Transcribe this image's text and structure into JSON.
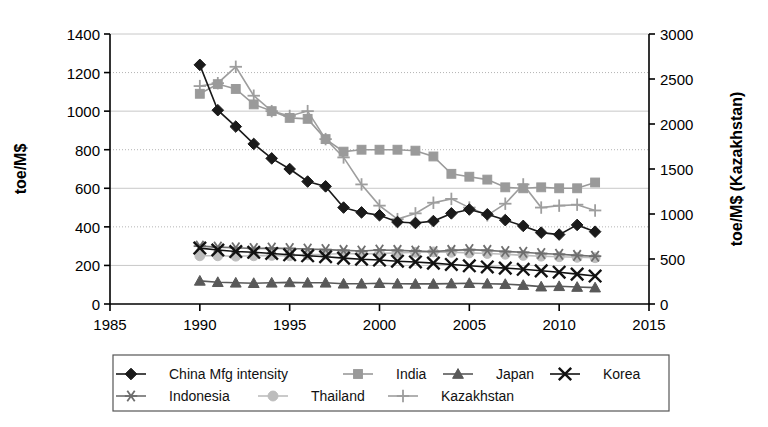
{
  "chart_data": {
    "type": "line",
    "title": "",
    "xlabel": "",
    "ylabel": "toe/M$",
    "ylabel_right": "toe/M$ (Kazakhstan)",
    "xlim": [
      1985,
      2015
    ],
    "ylim": [
      0,
      1400
    ],
    "ylim_right": [
      0,
      3000
    ],
    "xticks": [
      1985,
      1990,
      1995,
      2000,
      2005,
      2010,
      2015
    ],
    "yticks": [
      0,
      200,
      400,
      600,
      800,
      1000,
      1200,
      1400
    ],
    "yticks_right": [
      0,
      500,
      1000,
      1500,
      2000,
      2500,
      3000
    ],
    "grid": true,
    "legend_position": "bottom",
    "x": [
      1990,
      1991,
      1992,
      1993,
      1994,
      1995,
      1996,
      1997,
      1998,
      1999,
      2000,
      2001,
      2002,
      2003,
      2004,
      2005,
      2006,
      2007,
      2008,
      2009,
      2010,
      2011,
      2012
    ],
    "series": [
      {
        "name": "China Mfg intensity",
        "marker": "diamond",
        "color": "#1a1a1a",
        "axis": "left",
        "values": [
          1240,
          1005,
          920,
          830,
          755,
          700,
          635,
          610,
          500,
          475,
          460,
          425,
          420,
          430,
          470,
          490,
          465,
          435,
          405,
          370,
          360,
          410,
          375
        ]
      },
      {
        "name": "India",
        "marker": "square",
        "color": "#9a9a9a",
        "axis": "left",
        "values": [
          1090,
          1140,
          1115,
          1035,
          1000,
          965,
          960,
          855,
          790,
          800,
          800,
          800,
          795,
          765,
          675,
          660,
          645,
          605,
          600,
          605,
          600,
          600,
          630
        ]
      },
      {
        "name": "Japan",
        "marker": "triangle",
        "color": "#595959",
        "axis": "left",
        "values": [
          120,
          113,
          110,
          108,
          110,
          112,
          110,
          110,
          105,
          105,
          108,
          105,
          104,
          104,
          106,
          108,
          105,
          103,
          98,
          90,
          92,
          88,
          85
        ]
      },
      {
        "name": "Korea",
        "marker": "cross",
        "color": "#111111",
        "axis": "left",
        "values": [
          290,
          280,
          272,
          268,
          262,
          255,
          250,
          245,
          238,
          232,
          228,
          222,
          218,
          212,
          205,
          198,
          192,
          186,
          180,
          172,
          165,
          155,
          145
        ]
      },
      {
        "name": "Indonesia",
        "marker": "asterisk",
        "color": "#6e6e6e",
        "axis": "left",
        "values": [
          300,
          295,
          292,
          288,
          290,
          288,
          285,
          282,
          278,
          275,
          280,
          278,
          275,
          272,
          278,
          282,
          278,
          272,
          268,
          262,
          258,
          252,
          248
        ]
      },
      {
        "name": "Thailand",
        "marker": "circle",
        "color": "#bdbdbd",
        "axis": "left",
        "values": [
          250,
          250,
          248,
          250,
          252,
          250,
          255,
          258,
          262,
          260,
          262,
          265,
          268,
          270,
          268,
          265,
          262,
          258,
          252,
          248,
          245,
          242,
          240
        ]
      },
      {
        "name": "Kazakhstan",
        "marker": "plus",
        "color": "#9e9e9e",
        "axis": "left",
        "values": [
          1130,
          1145,
          1230,
          1080,
          1000,
          975,
          1000,
          855,
          760,
          620,
          510,
          440,
          470,
          525,
          545,
          500,
          460,
          520,
          620,
          500,
          510,
          515,
          485
        ]
      }
    ]
  },
  "legend": {
    "items": [
      {
        "label": "China Mfg intensity",
        "marker": "diamond",
        "color": "#1a1a1a"
      },
      {
        "label": "India",
        "marker": "square",
        "color": "#9a9a9a"
      },
      {
        "label": "Japan",
        "marker": "triangle",
        "color": "#595959"
      },
      {
        "label": "Korea",
        "marker": "cross",
        "color": "#111111"
      },
      {
        "label": "Indonesia",
        "marker": "asterisk",
        "color": "#6e6e6e"
      },
      {
        "label": "Thailand",
        "marker": "circle",
        "color": "#bdbdbd"
      },
      {
        "label": "Kazakhstan",
        "marker": "plus",
        "color": "#9e9e9e"
      }
    ]
  },
  "style": {
    "axis_color": "#000000",
    "grid_solid_color": "#c8c8c8",
    "grid_dotted_color": "#b4b4b4",
    "background": "#ffffff"
  }
}
